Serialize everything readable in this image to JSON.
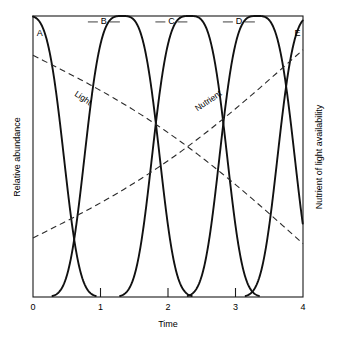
{
  "figure": {
    "background_color": "#ffffff",
    "line_color": "#111111",
    "dash_color": "#2a2a2a"
  },
  "axes": {
    "left_title": "Relative abundance",
    "right_title": "Nutrient of light availability",
    "bottom_title": "Time",
    "x_ticks": [
      "0",
      "1",
      "2",
      "3",
      "4"
    ],
    "x_tick_values": [
      0,
      1,
      2,
      3,
      4
    ],
    "minor_tick_values": [
      1,
      2,
      3
    ]
  },
  "chart_data": {
    "type": "line",
    "title": "",
    "xlabel": "Time",
    "ylabel": "Relative abundance",
    "y2label": "Nutrient of light availability",
    "xlim": [
      0,
      4
    ],
    "ylim": [
      0,
      1
    ],
    "grid": false,
    "legend": "inline-labels",
    "x_ticks": [
      0,
      1,
      2,
      3,
      4
    ],
    "series": [
      {
        "name": "A",
        "label": "A",
        "style": "solid",
        "kind": "species-abundance",
        "peak_x": -0.1,
        "peak_y": 1.0,
        "width": 0.62,
        "exponent": 3.4,
        "label_x": 0.1,
        "label_y": 0.93,
        "note": "declining from left edge, crosses zero near t=1"
      },
      {
        "name": "B",
        "label": "B",
        "style": "solid",
        "kind": "species-abundance",
        "peak_x": 1.32,
        "peak_y": 1.0,
        "width": 0.62,
        "exponent": 3.4,
        "label_x": 1.05,
        "label_y": 0.97,
        "note": "peaks between t=1 and t=2"
      },
      {
        "name": "C",
        "label": "C",
        "style": "solid",
        "kind": "species-abundance",
        "peak_x": 2.32,
        "peak_y": 1.0,
        "width": 0.62,
        "exponent": 3.4,
        "label_x": 2.05,
        "label_y": 0.97,
        "note": "peaks between t=2 and t=3"
      },
      {
        "name": "D",
        "label": "D",
        "style": "solid",
        "kind": "species-abundance",
        "peak_x": 3.32,
        "peak_y": 1.0,
        "width": 0.62,
        "exponent": 3.4,
        "label_x": 3.05,
        "label_y": 0.97,
        "note": "peaks between t=3 and t=4"
      },
      {
        "name": "E",
        "label": "E",
        "style": "solid",
        "kind": "species-abundance",
        "peak_x": 4.18,
        "peak_y": 1.0,
        "width": 0.62,
        "exponent": 3.4,
        "label_x": 3.92,
        "label_y": 0.93,
        "note": "rising toward right edge"
      },
      {
        "name": "Light",
        "label": "Light",
        "style": "dashed",
        "kind": "resource",
        "direction": "decreasing",
        "x_start": 0.0,
        "y_start": 0.86,
        "x_end": 4.0,
        "y_end": 0.19,
        "curvature": 0.06,
        "label_x": 0.72,
        "label_y": 0.7,
        "label_rotation": 34
      },
      {
        "name": "Nutrient",
        "label": "Nutrient",
        "style": "dashed",
        "kind": "resource",
        "direction": "increasing",
        "x_start": 0.0,
        "y_start": 0.21,
        "x_end": 4.0,
        "y_end": 0.88,
        "curvature": -0.06,
        "label_x": 2.62,
        "label_y": 0.69,
        "label_rotation": -34
      }
    ]
  }
}
